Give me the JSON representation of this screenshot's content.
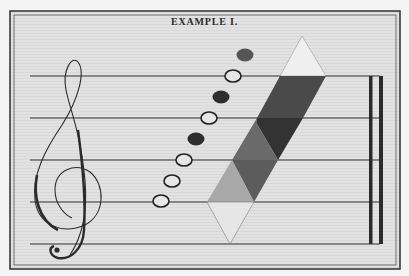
{
  "plate": {
    "title": "EXAMPLE I.",
    "colors": {
      "paper": "#dedede",
      "frame": "#3a3a3a",
      "ink": "#2b2b2b",
      "diamond_top": "#efefef",
      "diamond_upper_dark": "#4a4a4a",
      "diamond_darkest": "#333333",
      "diamond_mid": "#6a6a6a",
      "diamond_midlow": "#5c5c5c",
      "diamond_light": "#a8a8a8",
      "diamond_bottom": "#e6e6e6"
    },
    "staff": {
      "line_count": 5,
      "line_y": [
        76,
        118,
        160,
        202,
        244
      ],
      "x_start": 30,
      "x_end": 380
    },
    "clef": {
      "type": "treble-clef"
    },
    "notes": [
      {
        "x": 161,
        "y": 201,
        "filled": false
      },
      {
        "x": 172,
        "y": 181,
        "filled": false
      },
      {
        "x": 184,
        "y": 160,
        "filled": false
      },
      {
        "x": 196,
        "y": 139,
        "filled": true
      },
      {
        "x": 209,
        "y": 118,
        "filled": false
      },
      {
        "x": 221,
        "y": 97,
        "filled": true
      },
      {
        "x": 233,
        "y": 76,
        "filled": false
      },
      {
        "x": 245,
        "y": 55,
        "filled": true
      }
    ],
    "barline": {
      "type": "double-bar",
      "x_thin": 370,
      "x_thick": 381
    }
  }
}
